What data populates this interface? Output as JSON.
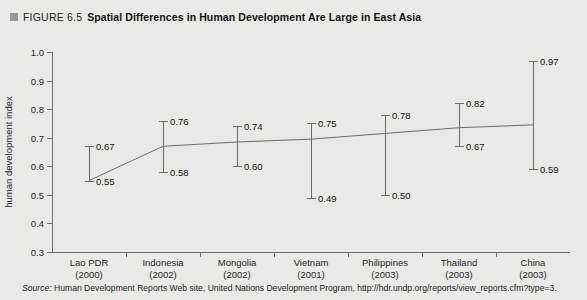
{
  "header": {
    "bullet_icon": "square-bullet-icon",
    "figure_number": "FIGURE 6.5",
    "title": "Spatial Differences in Human Development Are Large in East Asia"
  },
  "source": {
    "label": "Source:",
    "text": "Human Development Reports Web site, United Nations Development Program, http://hdr.undp.org/reports/view_reports.cfm?type=3."
  },
  "chart_data": {
    "type": "bar",
    "subtype": "range-with-connecting-line",
    "title": "Spatial Differences in Human Development Are Large in East Asia",
    "xlabel": "",
    "ylabel": "human development index",
    "ylim": [
      0.3,
      1.0
    ],
    "yticks": [
      "1.0",
      "0.9",
      "0.8",
      "0.7",
      "0.6",
      "0.5",
      "0.4",
      "0.3"
    ],
    "ytick_values": [
      1.0,
      0.9,
      0.8,
      0.7,
      0.6,
      0.5,
      0.4,
      0.3
    ],
    "grid": false,
    "legend": "none",
    "categories": [
      "Lao PDR",
      "Indonesia",
      "Mongolia",
      "Vietnam",
      "Philippines",
      "Thailand",
      "China"
    ],
    "years": [
      "(2000)",
      "(2002)",
      "(2002)",
      "(2001)",
      "(2003)",
      "(2003)",
      "(2003)"
    ],
    "series": [
      {
        "name": "high",
        "values": [
          0.67,
          0.76,
          0.74,
          0.75,
          0.78,
          0.82,
          0.97
        ]
      },
      {
        "name": "low",
        "values": [
          0.55,
          0.58,
          0.6,
          0.49,
          0.5,
          0.67,
          0.59
        ]
      }
    ],
    "high_labels": [
      "0.67",
      "0.76",
      "0.74",
      "0.75",
      "0.78",
      "0.82",
      "0.97"
    ],
    "low_labels": [
      "0.55",
      "0.58",
      "0.60",
      "0.49",
      "0.50",
      "0.67",
      "0.59"
    ],
    "connecting_line": {
      "name": "national average",
      "values": [
        0.55,
        0.67,
        0.685,
        0.695,
        0.715,
        0.735,
        0.745
      ]
    },
    "colors": {
      "background": "#e9e9e7",
      "axis": "#6e6e6e",
      "series": "#6b6b6b",
      "bullet": "#9a9a99"
    }
  }
}
